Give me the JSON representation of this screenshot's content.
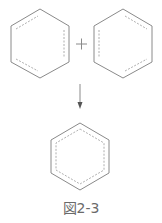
{
  "figure": {
    "caption": "図2-3",
    "reactants": [
      {
        "name": "kekule-structure-a",
        "double_bonds": [
          "upper-left",
          "right",
          "lower-left"
        ]
      },
      {
        "name": "kekule-structure-b",
        "double_bonds": [
          "upper-right",
          "left",
          "lower-right"
        ]
      }
    ],
    "operator": "+",
    "arrow": "down",
    "product": {
      "name": "resonance-hybrid",
      "delocalized": true
    },
    "colors": {
      "line": "#8a8a8a",
      "text": "#6a6a6a",
      "background": "#ffffff"
    }
  }
}
